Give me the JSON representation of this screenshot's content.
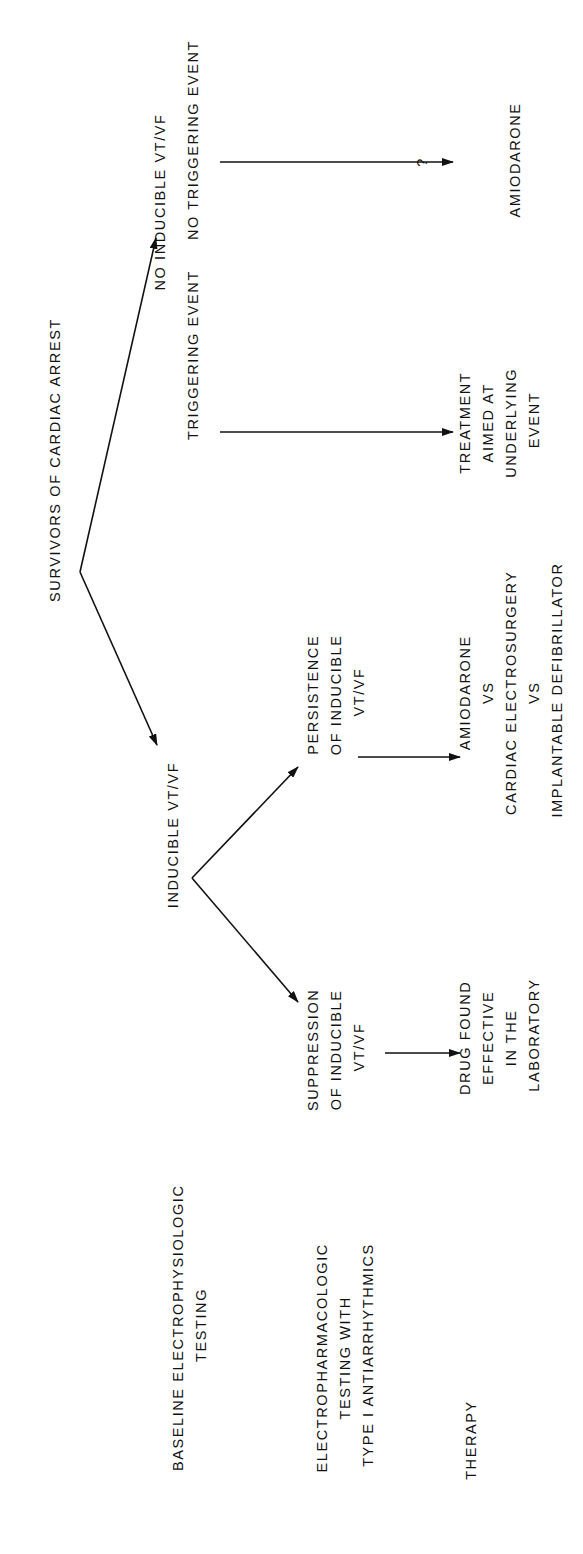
{
  "diagram": {
    "orientation": "rotated-90-ccw",
    "colors": {
      "ink": "#111111",
      "background": "#ffffff"
    },
    "root": {
      "label": "SURVIVORS OF CARDIAC ARREST"
    },
    "row_labels": {
      "baseline": [
        "BASELINE ELECTROPHYSIOLOGIC",
        "TESTING"
      ],
      "electropharm": [
        "ELECTROPHARMACOLOGIC",
        "TESTING WITH",
        "TYPE I ANTIARRHYTHMICS"
      ],
      "therapy": [
        "THERAPY"
      ]
    },
    "nodes": {
      "inducible": [
        "INDUCIBLE VT/VF"
      ],
      "no_inducible": [
        "NO INDUCIBLE VT/VF"
      ],
      "triggering_event": [
        "TRIGGERING EVENT"
      ],
      "no_triggering_event": [
        "NO TRIGGERING EVENT"
      ],
      "persistence": [
        "PERSISTENCE",
        "OF INDUCIBLE",
        "VT/VF"
      ],
      "suppression": [
        "SUPPRESSION",
        "OF INDUCIBLE",
        "VT/VF"
      ],
      "therapy_persistence": [
        "AMIODARONE",
        "VS",
        "CARDIAC ELECTROSURGERY",
        "VS",
        "IMPLANTABLE DEFIBRILLATOR"
      ],
      "therapy_suppression": [
        "DRUG FOUND",
        "EFFECTIVE",
        "IN THE",
        "LABORATORY"
      ],
      "therapy_triggering": [
        "TREATMENT",
        "AIMED AT",
        "UNDERLYING",
        "EVENT"
      ],
      "therapy_no_triggering_q": "?",
      "therapy_no_triggering": [
        "AMIODARONE"
      ]
    },
    "edges": [
      {
        "from": "SURVIVORS OF CARDIAC ARREST",
        "to": "INDUCIBLE VT/VF"
      },
      {
        "from": "SURVIVORS OF CARDIAC ARREST",
        "to": "NO INDUCIBLE VT/VF"
      },
      {
        "from": "INDUCIBLE VT/VF",
        "to": "PERSISTENCE OF INDUCIBLE VT/VF"
      },
      {
        "from": "INDUCIBLE VT/VF",
        "to": "SUPPRESSION OF INDUCIBLE VT/VF"
      },
      {
        "from": "PERSISTENCE OF INDUCIBLE VT/VF",
        "to": "AMIODARONE VS CARDIAC ELECTROSURGERY VS IMPLANTABLE DEFIBRILLATOR"
      },
      {
        "from": "SUPPRESSION OF INDUCIBLE VT/VF",
        "to": "DRUG FOUND EFFECTIVE IN THE LABORATORY"
      },
      {
        "from": "TRIGGERING EVENT",
        "to": "TREATMENT AIMED AT UNDERLYING EVENT"
      },
      {
        "from": "NO TRIGGERING EVENT",
        "to": "? AMIODARONE"
      }
    ]
  }
}
